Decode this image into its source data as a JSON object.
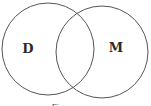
{
  "diagram": {
    "type": "venn",
    "stroke_color": "#555555",
    "sets": [
      {
        "label": "D",
        "cx": 48,
        "cy": 49,
        "r": 46
      },
      {
        "label": "M",
        "cx": 102,
        "cy": 52,
        "r": 46
      }
    ],
    "caption": "Fig."
  }
}
